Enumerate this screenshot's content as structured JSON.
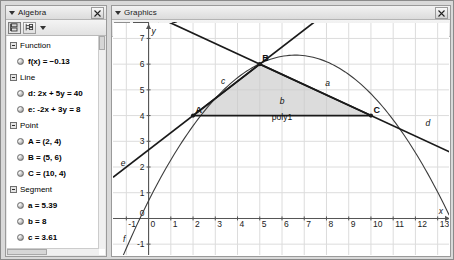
{
  "window": {
    "background": "#d9d9d9"
  },
  "algebra_panel": {
    "title": "Algebra",
    "collapse_icon": "triangle-down-icon",
    "close_icon": "close-icon",
    "toolbar": {
      "sort_button_icon": "sort-objects-icon",
      "tree_button_icon": "tree-view-icon",
      "dropdown_icon": "chevron-down-icon"
    },
    "tree": [
      {
        "type": "group",
        "label": "Function"
      },
      {
        "type": "item",
        "label": "f(x) = −0.13"
      },
      {
        "type": "group",
        "label": "Line"
      },
      {
        "type": "item",
        "label": "d: 2x + 5y = 40"
      },
      {
        "type": "item",
        "label": "e: -2x + 3y = 8"
      },
      {
        "type": "group",
        "label": "Point"
      },
      {
        "type": "item",
        "label": "A = (2, 4)"
      },
      {
        "type": "item",
        "label": "B = (5, 6)"
      },
      {
        "type": "item",
        "label": "C = (10, 4)"
      },
      {
        "type": "group",
        "label": "Segment"
      },
      {
        "type": "item",
        "label": "a = 5.39"
      },
      {
        "type": "item",
        "label": "b = 8"
      },
      {
        "type": "item",
        "label": "c = 3.61"
      },
      {
        "type": "group",
        "label": "Triangle"
      }
    ]
  },
  "graphics_panel": {
    "title": "Graphics",
    "collapse_icon": "triangle-down-icon",
    "close_icon": "close-icon",
    "toolbar": {
      "axes_button_icon": "axes-icon",
      "grid_button_icon": "grid-icon",
      "home_button_icon": "home-icon",
      "undo_button_icon": "undo-c-icon",
      "dropdown_icon": "chevron-down-icon"
    }
  },
  "chart_data": {
    "type": "scatter",
    "title": "",
    "xlabel": "x",
    "ylabel": "y",
    "xlim": [
      -1.6,
      13.6
    ],
    "ylim": [
      -1.5,
      7.6
    ],
    "grid": true,
    "xticks": [
      -1,
      0,
      1,
      2,
      3,
      4,
      5,
      6,
      7,
      8,
      9,
      10,
      11,
      12,
      13
    ],
    "yticks": [
      -1,
      0,
      1,
      2,
      3,
      4,
      5,
      6,
      7
    ],
    "axis_label_x": "x",
    "axis_label_y": "y",
    "points": [
      {
        "name": "A",
        "x": 2,
        "y": 4
      },
      {
        "name": "B",
        "x": 5,
        "y": 6
      },
      {
        "name": "C",
        "x": 10,
        "y": 4
      }
    ],
    "lines": [
      {
        "name": "d",
        "equation": "2x + 5y = 40",
        "slope": -0.4,
        "intercept": 8,
        "label": "d"
      },
      {
        "name": "e",
        "equation": "-2x + 3y = 8",
        "slope": 0.666667,
        "intercept": 2.666667,
        "label": "e"
      }
    ],
    "curves": [
      {
        "name": "f",
        "kind": "parabola",
        "label": "f",
        "a": -0.13,
        "vertex_x": 6.6,
        "vertex_y": 6.35,
        "note": "f(x) = −0.13"
      }
    ],
    "polygon": {
      "name": "poly1",
      "label": "poly1",
      "vertices": [
        [
          2,
          4
        ],
        [
          5,
          6
        ],
        [
          10,
          4
        ]
      ],
      "fill": "#c9c9c9",
      "fill_opacity": 0.65
    },
    "segments": [
      {
        "name": "c",
        "label": "c",
        "from": "A",
        "to": "B",
        "length": 3.61
      },
      {
        "name": "a",
        "label": "a",
        "from": "B",
        "to": "C",
        "length": 5.39
      },
      {
        "name": "b",
        "label": "b",
        "from": "A",
        "to": "C",
        "length": 8
      }
    ],
    "annotations": [
      "A",
      "B",
      "C",
      "a",
      "b",
      "c",
      "d",
      "e",
      "f",
      "poly1",
      "x",
      "y"
    ]
  },
  "colors": {
    "grid": "#dcdcdc",
    "axis": "#555555",
    "object": "#1a1a1a",
    "panel_bg": "#e8e8e8",
    "plot_bg": "#ffffff"
  }
}
